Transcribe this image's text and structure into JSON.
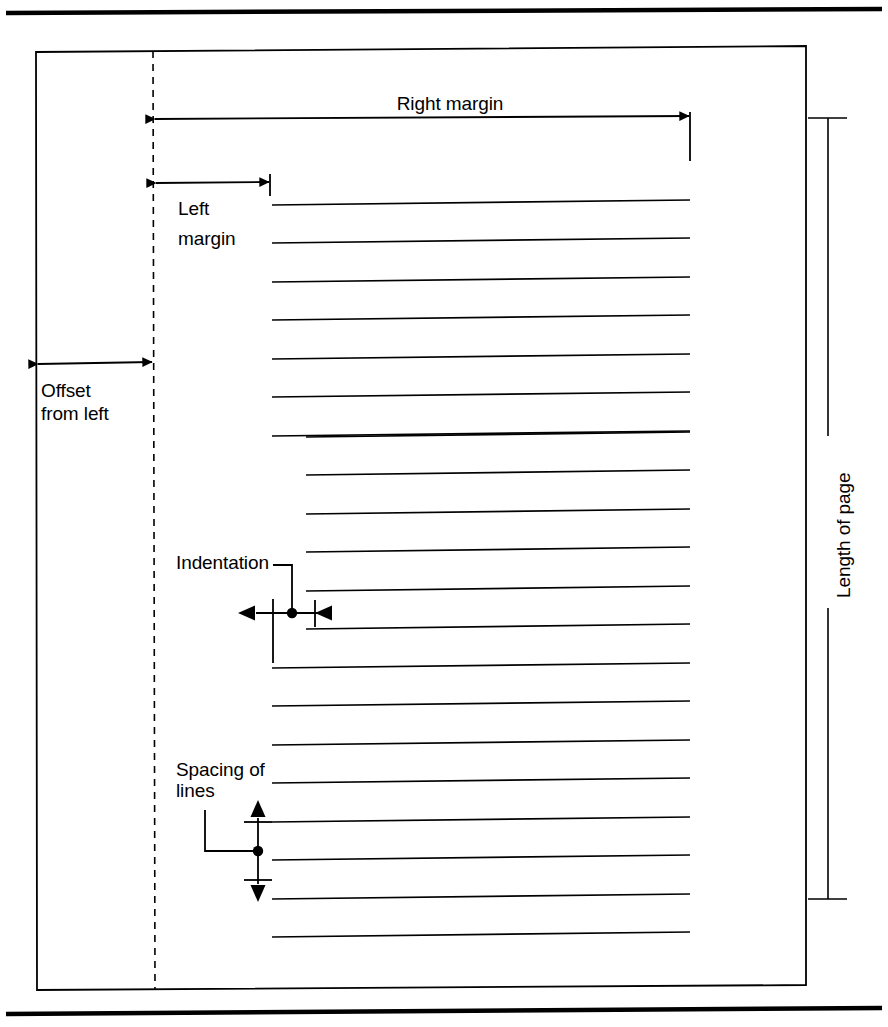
{
  "figure": {
    "type": "page-layout-dimension-diagram",
    "line_color": "#000000",
    "background_color": "#ffffff",
    "page_border_color": "#000000"
  },
  "labels": {
    "right_margin": "Right margin",
    "left_margin": "Left\nmargin",
    "left_margin_line1": "Left",
    "left_margin_line2": "margin",
    "offset_from_left": "Offset\nfrom left",
    "offset_from_left_line1": "Offset",
    "offset_from_left_line2": "from left",
    "indentation": "Indentation",
    "spacing_of_lines": "Spacing of\nlines",
    "spacing_of_lines_line1": "Spacing of",
    "spacing_of_lines_line2": "lines",
    "length_of_page": "Length of page"
  },
  "geometry": {
    "page_rect": {
      "x": 36,
      "y": 51,
      "width": 770,
      "height": 938
    },
    "offset_guide_x": 153,
    "text_left_x": 272,
    "text_right_x": 690,
    "indent_left_x": 306,
    "text_line_count": 20,
    "text_line_first_y": 203,
    "text_line_spacing": 38.5,
    "indented_line_indices": [
      8,
      9,
      10,
      11,
      12,
      13,
      14
    ],
    "top_rule_y": 12,
    "bottom_rule_y": 1010
  },
  "callouts": [
    {
      "name": "right-margin",
      "label": "Right margin",
      "style": "double-arrow-horizontal",
      "from_x": 155,
      "to_x": 690,
      "y": 118
    },
    {
      "name": "left-margin",
      "label": "Left margin",
      "style": "double-arrow-horizontal",
      "from_x": 155,
      "to_x": 270,
      "y": 182
    },
    {
      "name": "offset-from-left",
      "label": "Offset from left",
      "style": "double-arrow-horizontal",
      "from_x": 37,
      "to_x": 153,
      "y": 363
    },
    {
      "name": "indentation",
      "label": "Indentation",
      "style": "leader-with-horizontal-marker",
      "marker_x": 292,
      "marker_y": 613
    },
    {
      "name": "spacing-of-lines",
      "label": "Spacing of lines",
      "style": "leader-with-vertical-marker",
      "marker_x": 258,
      "marker_y": 851
    },
    {
      "name": "length-of-page",
      "label": "Length of page",
      "style": "bracket-vertical",
      "x": 828,
      "from_y": 118,
      "to_y": 899
    }
  ]
}
